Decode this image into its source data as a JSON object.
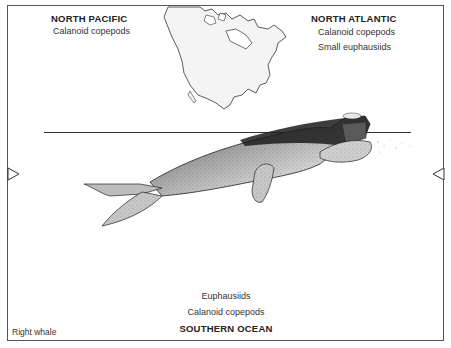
{
  "diagram": {
    "species_label": "Right whale",
    "regions": {
      "north_pacific": {
        "title": "NORTH PACIFIC",
        "prey": [
          "Calanoid copepods"
        ]
      },
      "north_atlantic": {
        "title": "NORTH ATLANTIC",
        "prey": [
          "Calanoid copepods",
          "Small euphausiids"
        ]
      },
      "southern_ocean": {
        "title": "SOUTHERN OCEAN",
        "prey": [
          "Euphausiids",
          "Calanoid copepods"
        ]
      }
    },
    "illustrations": {
      "map": "North America outline map",
      "whale": "Right whale stippled drawing at surface"
    },
    "markers": {
      "left": "right-pointing triangle",
      "right": "left-pointing triangle"
    },
    "colors": {
      "line": "#333333",
      "map_fill": "#f4f4f4",
      "whale_dark": "#1c1c1c",
      "whale_light": "#d8d8d8"
    }
  }
}
